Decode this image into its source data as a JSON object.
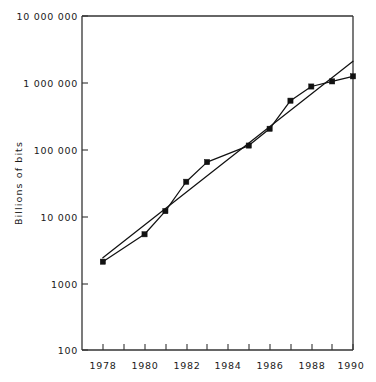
{
  "chart_data": {
    "type": "line",
    "title": "",
    "subtitle": "",
    "xlabel": "",
    "ylabel": "Billions of bits",
    "y_scale": "log",
    "ylim": [
      100,
      10000000
    ],
    "xlim": [
      1977,
      1990
    ],
    "grid": false,
    "legend": null,
    "y_tick_labels": [
      "10 000 000",
      "1 000 000",
      "100 000",
      "10 000",
      "1000",
      "100"
    ],
    "y_tick_values": [
      10000000,
      1000000,
      100000,
      10000,
      1000,
      100
    ],
    "x_tick_labels": [
      "1978",
      "1980",
      "1982",
      "1984",
      "1986",
      "1988",
      "1990"
    ],
    "x_tick_values": [
      1978,
      1980,
      1982,
      1984,
      1986,
      1988,
      1990
    ],
    "x_minor_tick_values": [
      1979,
      1981,
      1983,
      1985,
      1987,
      1989
    ],
    "series": [
      {
        "name": "data-series",
        "marker": "square",
        "x": [
          1978,
          1980,
          1981,
          1982,
          1983,
          1985,
          1986,
          1987,
          1988,
          1989,
          1990
        ],
        "values": [
          2100,
          5400,
          12000,
          33000,
          65000,
          115000,
          205000,
          540000,
          880000,
          1050000,
          1250000
        ]
      },
      {
        "name": "trend-line",
        "marker": "none",
        "x": [
          1978,
          1990
        ],
        "values": [
          2400,
          2100000
        ]
      }
    ]
  },
  "figure": {
    "plot_area": {
      "left": 82,
      "top": 16,
      "right": 353,
      "bottom": 350
    }
  }
}
